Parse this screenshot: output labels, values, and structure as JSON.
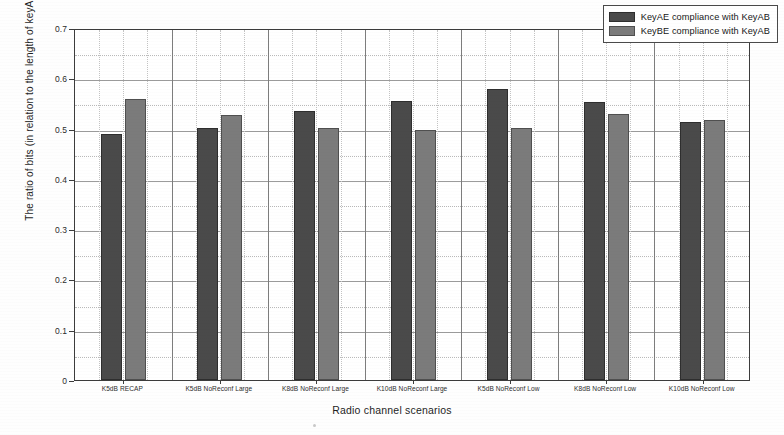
{
  "chart_data": {
    "type": "bar",
    "title": "",
    "xlabel": "Radio channel scenarios",
    "ylabel": "The ratio of bits (in relation to the length of keyAB)",
    "ylim": [
      0,
      0.7
    ],
    "ytick_labels": [
      "0",
      "0.1",
      "0.2",
      "0.3",
      "0.4",
      "0.5",
      "0.6",
      "0.7"
    ],
    "ytick_values": [
      0,
      0.1,
      0.2,
      0.3,
      0.4,
      0.5,
      0.6,
      0.7
    ],
    "grid": true,
    "legend_position": "top-right",
    "categories": [
      "K5dB RECAP",
      "K5dB NoReconf Large",
      "K8dB NoReconf Large",
      "K10dB NoReconf Large",
      "K5dB NoReconf Low",
      "K8dB NoReconf Low",
      "K10dB NoReconf Low"
    ],
    "series": [
      {
        "name": "KeyAE compliance with KeyAB",
        "color": "#4a4a4a",
        "values": [
          0.49,
          0.501,
          0.535,
          0.555,
          0.578,
          0.553,
          0.513
        ]
      },
      {
        "name": "KeyBE compliance with KeyAB",
        "color": "#7b7b7b",
        "values": [
          0.558,
          0.527,
          0.501,
          0.497,
          0.501,
          0.53,
          0.518
        ]
      }
    ]
  },
  "legend": {
    "items": [
      {
        "label": "KeyAE compliance with KeyAB"
      },
      {
        "label": "KeyBE compliance with KeyAB"
      }
    ]
  }
}
